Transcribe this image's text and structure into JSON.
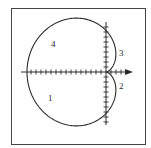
{
  "diagram": {
    "type": "polar-curve",
    "curve": "cardioid",
    "equation_form": "r = a(1 - cos θ)",
    "region_labels": [
      {
        "id": "region-1",
        "text": "1",
        "x": 51,
        "y": 99
      },
      {
        "id": "region-2",
        "text": "2",
        "x": 121,
        "y": 86
      },
      {
        "id": "region-3",
        "text": "3",
        "x": 121,
        "y": 52
      },
      {
        "id": "region-4",
        "text": "4",
        "x": 53,
        "y": 40
      }
    ],
    "axes": {
      "origin": {
        "x": 106,
        "y": 72
      },
      "x_axis": {
        "from": 21,
        "to": 133,
        "arrow": true,
        "tick_spacing": 5
      },
      "y_axis": {
        "from": 22,
        "to": 125,
        "arrow": false,
        "tick_spacing": 5
      }
    },
    "frame": {
      "x": 11,
      "y": 8,
      "width": 135,
      "height": 137
    },
    "colors": {
      "stroke": "#2a2a2a",
      "frame": "#444444",
      "background": "#ffffff"
    }
  }
}
